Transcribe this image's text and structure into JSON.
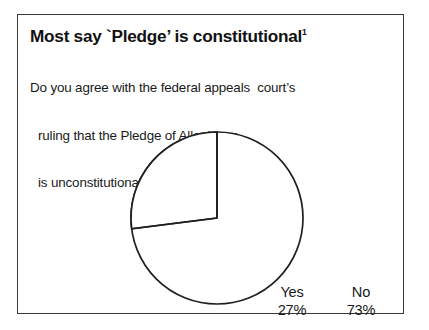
{
  "figure": {
    "title": "Most say `Pledge’ is constitutional",
    "title_footnote_marker": "1",
    "subtitle_lines": [
      "Do you agree with the federal appeals  court’s",
      "ruling that the Pledge of Allegiance",
      "is unconstitutional?"
    ],
    "border_color": "#3a3a3a",
    "background_color": "#ffffff"
  },
  "chart_data": {
    "type": "pie",
    "title": "Most say `Pledge’ is constitutional",
    "subtitle": "Do you agree with the federal appeals  court’s ruling that the Pledge of Allegiance is unconstitutional?",
    "categories": [
      "Yes",
      "No"
    ],
    "values": [
      27,
      73
    ],
    "value_unit": "%",
    "labels": [
      {
        "name": "Yes",
        "value": 27,
        "value_text": "27%"
      },
      {
        "name": "No",
        "value": 73,
        "value_text": "73%"
      }
    ],
    "slice_fill_color": "#ffffff",
    "slice_stroke_color": "#1f1f1f",
    "start_angle_deg": 0,
    "direction": "counterclockwise",
    "legend": "none",
    "grid": false,
    "xlabel": "",
    "ylabel": ""
  }
}
